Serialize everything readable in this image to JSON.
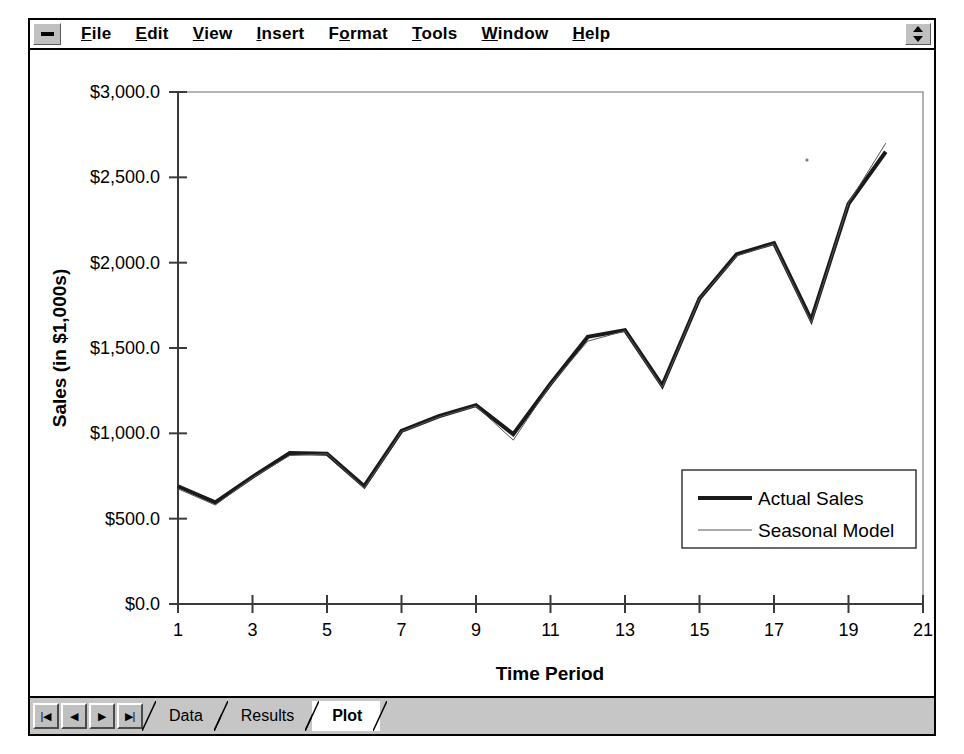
{
  "window": {
    "system_menu_icon": "minimize-box-icon",
    "restore_icon": "restore-updown-arrow-icon"
  },
  "menu": {
    "items": [
      {
        "label": "File",
        "accel": "F"
      },
      {
        "label": "Edit",
        "accel": "E"
      },
      {
        "label": "View",
        "accel": "V"
      },
      {
        "label": "Insert",
        "accel": "I"
      },
      {
        "label": "Format",
        "accel": "o"
      },
      {
        "label": "Tools",
        "accel": "T"
      },
      {
        "label": "Window",
        "accel": "W"
      },
      {
        "label": "Help",
        "accel": "H"
      }
    ]
  },
  "tabbar": {
    "nav_buttons": [
      {
        "name": "first-sheet-button",
        "glyph": "|◀"
      },
      {
        "name": "previous-sheet-button",
        "glyph": "◀"
      },
      {
        "name": "next-sheet-button",
        "glyph": "▶"
      },
      {
        "name": "last-sheet-button",
        "glyph": "▶|"
      }
    ],
    "sheets": [
      {
        "label": "Data",
        "active": false
      },
      {
        "label": "Results",
        "active": false
      },
      {
        "label": "Plot",
        "active": true
      }
    ]
  },
  "chart_data": {
    "type": "line",
    "title": "",
    "xlabel": "Time Period",
    "ylabel": "Sales (in $1,000s)",
    "xlim": [
      1,
      21
    ],
    "ylim": [
      0,
      3000
    ],
    "xticks": [
      1,
      3,
      5,
      7,
      9,
      11,
      13,
      15,
      17,
      19,
      21
    ],
    "xticklabels": [
      "1",
      "3",
      "5",
      "7",
      "9",
      "11",
      "13",
      "15",
      "17",
      "19",
      "21"
    ],
    "yticks": [
      0,
      500,
      1000,
      1500,
      2000,
      2500,
      3000
    ],
    "yticklabels": [
      "$0.0",
      "$500.0",
      "$1,000.0",
      "$1,500.0",
      "$2,000.0",
      "$2,500.0",
      "$3,000.0"
    ],
    "grid": false,
    "legend_position": "lower right",
    "x": [
      1,
      2,
      3,
      4,
      5,
      6,
      7,
      8,
      9,
      10,
      11,
      12,
      13,
      14,
      15,
      16,
      17,
      18,
      19,
      20
    ],
    "series": [
      {
        "name": "Actual Sales",
        "style": "thick",
        "color": "#1a1a1a",
        "width": 4,
        "values": [
          690,
          595,
          745,
          885,
          880,
          690,
          1015,
          1100,
          1165,
          995,
          1290,
          1565,
          1605,
          1280,
          1790,
          2050,
          2115,
          1665,
          2345,
          2650
        ]
      },
      {
        "name": "Seasonal Model",
        "style": "thin",
        "color": "#555555",
        "width": 1,
        "values": [
          675,
          580,
          740,
          870,
          880,
          680,
          1010,
          1095,
          1160,
          960,
          1285,
          1540,
          1600,
          1270,
          1790,
          2040,
          2110,
          1650,
          2350,
          2700
        ]
      }
    ]
  }
}
